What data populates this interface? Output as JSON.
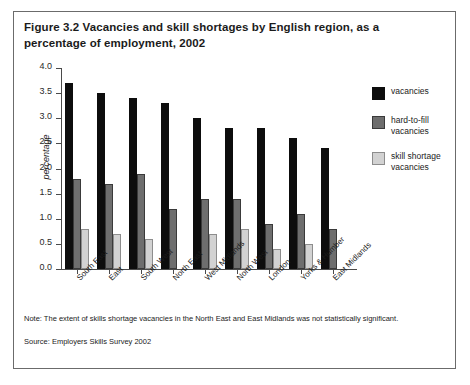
{
  "figure": {
    "title": "Figure 3.2 Vacancies and skill shortages by English region, as a percentage of employment, 2002",
    "note": "Note: The extent of skills shortage vacancies in the North East and East Midlands was not statistically significant.",
    "source": "Source: Employers Skills Survey 2002"
  },
  "colors": {
    "vacancies": "#0d0d0d",
    "hard_to_fill": "#6e6e6e",
    "skill_shortage": "#d2d2d2",
    "axis": "#4a4a4a",
    "frame": "#6b6b6b"
  },
  "chart_data": {
    "type": "bar",
    "title": "Figure 3.2 Vacancies and skill shortages by English region, as a percentage of employment, 2002",
    "xlabel": "",
    "ylabel": "percentage",
    "ylim": [
      0,
      4.0
    ],
    "ytick_labels": [
      "0.0",
      "0.5",
      "1.0",
      "1.5",
      "2.0",
      "2.5",
      "3.0",
      "3.5",
      "4.0"
    ],
    "ytick_values": [
      0,
      0.5,
      1.0,
      1.5,
      2.0,
      2.5,
      3.0,
      3.5,
      4.0
    ],
    "grid": false,
    "legend_position": "right",
    "categories": [
      "South East",
      "East",
      "South West",
      "North East",
      "West Midlands",
      "North West",
      "London",
      "Yorks & Humber",
      "East Midlands"
    ],
    "series": [
      {
        "name": "vacancies",
        "color": "#0d0d0d",
        "values": [
          3.7,
          3.5,
          3.4,
          3.3,
          3.0,
          2.8,
          2.8,
          2.6,
          2.4
        ]
      },
      {
        "name": "hard-to-fill vacancies",
        "color": "#6e6e6e",
        "values": [
          1.8,
          1.7,
          1.9,
          1.2,
          1.4,
          1.4,
          0.9,
          1.1,
          0.8
        ]
      },
      {
        "name": "skill shortage vacancies",
        "color": "#d2d2d2",
        "values": [
          0.8,
          0.7,
          0.6,
          null,
          0.7,
          0.8,
          0.4,
          0.5,
          null
        ]
      }
    ]
  },
  "legend": {
    "entries": [
      {
        "label": "vacancies",
        "series": "vacancies"
      },
      {
        "label": "hard-to-fill vacancies",
        "series": "hard-to-fill vacancies"
      },
      {
        "label": "skill shortage vacancies",
        "series": "skill shortage vacancies"
      }
    ]
  }
}
